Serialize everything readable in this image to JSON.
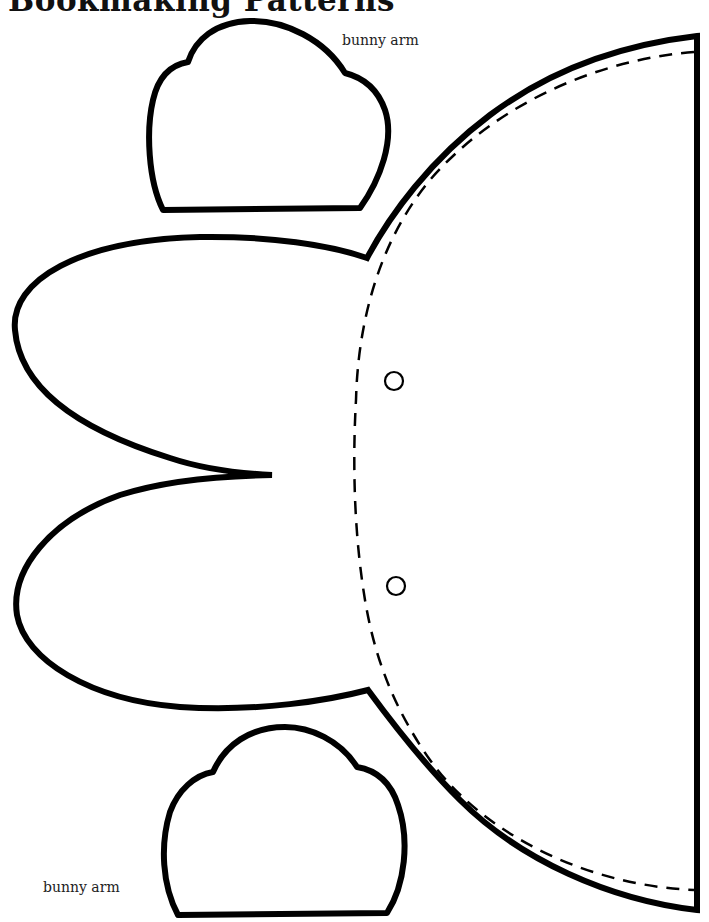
{
  "page": {
    "title": "Bookmaking Patterns",
    "background": "#ffffff",
    "ink_color": "#000000"
  },
  "labels": {
    "top_arm": "bunny arm",
    "bottom_arm": "bunny arm"
  },
  "pattern_pieces": [
    {
      "name": "bunny-arm-top",
      "label": "bunny arm",
      "outline": "solid"
    },
    {
      "name": "bunny-body-head",
      "outline": "solid",
      "fold_line": "dashed",
      "holes": 2
    },
    {
      "name": "bunny-arm-bottom",
      "label": "bunny arm",
      "outline": "solid"
    }
  ]
}
